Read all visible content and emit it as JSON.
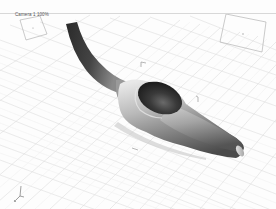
{
  "viewport": {
    "label": "Camera 1 100%",
    "view_type": "perspective",
    "background": "#fdfdfd",
    "grid_color": "#dcdcdc",
    "object": {
      "name": "shaded-mesh",
      "shading": "smooth grey",
      "colors": {
        "dark": "#2e2e2e",
        "mid": "#7a7a7a",
        "light": "#d9d9d9",
        "highlight": "#f2f2f2"
      }
    },
    "gizmo": {
      "axes": [
        "x",
        "y",
        "z"
      ]
    }
  }
}
